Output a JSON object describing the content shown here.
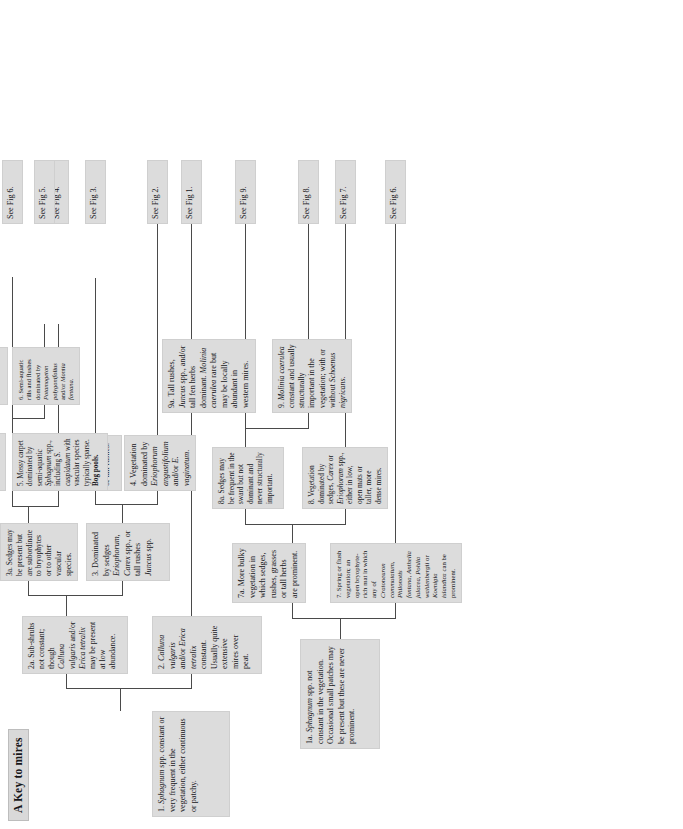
{
  "document": {
    "title": "A Key to mires",
    "orientation": "rotated-90-ccw",
    "type": "dichotomous-key-flow-diagram"
  },
  "colors": {
    "box_fill": "#dcdcdc",
    "box_border": "#cfcfcf",
    "title_fill": "#d9d9d9",
    "connector": "#4a4a4a",
    "text": "#16161a",
    "page_background": "#ffffff"
  },
  "nodes": {
    "n1": {
      "id": "1",
      "text": "1. Sphagnum spp. constant or very frequent in the vegetation, either continuous or patchy.",
      "html": "1. <i>Sphagnum</i> spp. constant or very frequent in the vegetation, either continuous or patchy."
    },
    "n1a": {
      "id": "1a",
      "text": "1a. Sphagnum spp. not constant in the vegetation. Occasional small patches may be present but these are never prominent.",
      "html": "1a. <i>Sphagnum</i> spp. not constant in the vegetation. Occasional small patches may be present but these are never prominent."
    },
    "n2": {
      "id": "2",
      "text": "2. Calluna vulgaris and/or Erica tetralix constant. Usually quite extensive mires over peat.",
      "html": "2. <i>Calluna vulgaris</i> and/or <i>Erica tetralix</i> constant. Usually quite extensive mires over peat."
    },
    "n2a": {
      "id": "2a",
      "text": "2a. Sub-shrubs not constant; though Calluna vulgaris and/or Erica tetralix may be present at low abundance.",
      "html": "2a. Sub-shrubs not constant; though <i>Calluna vulgaris</i> and/or <i>Erica tetralix</i> may be present at low abundance."
    },
    "n3": {
      "id": "3",
      "text": "3. Dominated by sedges Eriophorum, Carex spp., or tall rushes Juncus spp.",
      "html": "3. Dominated by sedges <i>Eriophorum</i>, <i>Carex</i> spp., or tall rushes <i>Juncus</i> spp."
    },
    "n3a": {
      "id": "3a",
      "text": "3a. Sedges may be present but are subordinate to bryophytes or to other vascular species.",
      "html": "3a. Sedges may be present but are subordinate to bryophytes or to other vascular species."
    },
    "n4": {
      "id": "4",
      "text": "4. Vegetation dominated by Eriophorum angustifolium and/or E. vaginatum.",
      "html": "4. Vegetation dominated by <i>Eriophorum angustifolium</i> and/or <i>E. vaginatum</i>."
    },
    "n4a": {
      "id": "4a",
      "text": "4a. Vegetation dominated by other sedges or tall rushes.",
      "html": "4a. Vegetation dominated by other sedges or tall rushes."
    },
    "n5": {
      "id": "5",
      "text": "5. Mossy carpet dominated by semi-aquatic Sphagnum spp., including S. cuspidatum with vascular species typically sparse. Bog pools.",
      "html": "5. Mossy carpet dominated by semi-aquatic <i>Sphagnum</i> spp., including <i>S. cuspidatum</i> with vascular species typically sparse. <b>Bog pools.</b>"
    },
    "n5a": {
      "id": "5a",
      "text": "5a. Open springs or rills with constant, but patchy Sphagnum auriculatum.",
      "html": "5a. Open springs or rills with constant, but patchy <i>Sphagnum auriculatum</i>."
    },
    "n6": {
      "id": "6",
      "text": "6. Semi-aquatic rills and flushes dominated by Potamogeton polygonifolius and/or Montia fontana.",
      "html": "6. Semi-aquatic rills and flushes dominated by <i>Potamogeton polygonifolius</i> and/or <i>Montia fontana</i>."
    },
    "n6a": {
      "id": "6a",
      "text": "6a. Open bryophyte mats around springs. Sphagnum auriculatum can be constant.",
      "html": "6a. Open bryophyte mats around springs. <i>Sphagnum auriculatum</i> can be constant."
    },
    "n7": {
      "id": "7",
      "text": "7. Spring or flush vegetation; an open bryophyte-rich mat in which any of Cratoneuron commutatum, Philonotis fontana, Anthelia julacea, Pohlia wahlenbergii or Koenigia islandica can be prominent.",
      "html": "7. Spring or flush vegetation; an open bryophyte-rich mat in which any of <i>Cratoneuron commutatum</i>, <i>Philonotis fontana</i>, <i>Anthelia julacea</i>, <i>Pohlia wahlenbergii</i> or <i>Koenigia islandica</i> can be prominent."
    },
    "n7a": {
      "id": "7a",
      "text": "7a. More bulky vegetation in which sedges, rushes, grasses or tall herbs are prominent.",
      "html": "7a. More bulky vegetation in which sedges, rushes, grasses or tall herbs are prominent."
    },
    "n8": {
      "id": "8",
      "text": "8. Vegetation dominated by sedges, Carex or Eriophorum spp., either in low, open mats or taller, more dense mires.",
      "html": "8. Vegetation dominated by sedges, <i>Carex</i> or <i>Eriophorum</i> spp., either in low, open mats or taller, more dense mires."
    },
    "n8a": {
      "id": "8a",
      "text": "8a. Sedges may be frequent in the sward but not dominant and never structurally important.",
      "html": "8a. Sedges may be frequent in the sward but not dominant and never structurally important."
    },
    "n9": {
      "id": "9",
      "text": "9. Molinia caerulea constant and usually structurally important in the vegetation; with or without Schoenus nigricans.",
      "html": "9. <i>Molinia caerulea</i> constant and usually structurally important in the vegetation; with or without <i>Schoenus nigricans</i>."
    },
    "n9a": {
      "id": "9a",
      "text": "9a. Tall rushes, Juncus spp., and/or tall fen herbs dominant. Molinia caerulea rare but may be locally abundant in western mires.",
      "html": "9a. Tall rushes, <i>Juncus</i> spp., and/or tall fen herbs dominant. <i>Molinia caerulea</i> rare but may be locally abundant in western mires."
    }
  },
  "figures": [
    {
      "key": "fig1",
      "label": "See Fig 1."
    },
    {
      "key": "fig2",
      "label": "See Fig 2."
    },
    {
      "key": "fig3",
      "label": "See Fig 3."
    },
    {
      "key": "fig4",
      "label": "See Fig 4."
    },
    {
      "key": "fig5",
      "label": "See Fig 5."
    },
    {
      "key": "fig6a",
      "label": "See Fig 6."
    },
    {
      "key": "fig6b",
      "label": "See Fig 6."
    },
    {
      "key": "fig7",
      "label": "See Fig 7."
    },
    {
      "key": "fig8",
      "label": "See Fig 8."
    },
    {
      "key": "fig9",
      "label": "See Fig 9."
    }
  ]
}
